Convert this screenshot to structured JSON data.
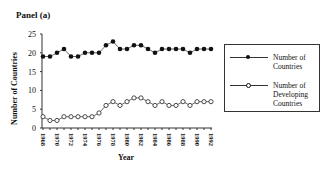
{
  "panel_title": "Panel (a)",
  "chart_data": {
    "type": "line",
    "title": "Panel (a)",
    "xlabel": "Year",
    "ylabel": "Number of Countries",
    "ylim": [
      0,
      25
    ],
    "yticks": [
      0,
      5,
      10,
      15,
      20,
      25
    ],
    "xticks": [
      "1968",
      "1970",
      "1972",
      "1974",
      "1976",
      "1978",
      "1980",
      "1982",
      "1984",
      "1986",
      "1988",
      "1990",
      "1992"
    ],
    "grid": false,
    "legend_position": "right",
    "x": [
      1968,
      1969,
      1970,
      1971,
      1972,
      1973,
      1974,
      1975,
      1976,
      1977,
      1978,
      1979,
      1980,
      1981,
      1982,
      1983,
      1984,
      1985,
      1986,
      1987,
      1988,
      1989,
      1990,
      1991,
      1992
    ],
    "series": [
      {
        "name": "Number of Countries",
        "marker": "filled-circle",
        "values": [
          19,
          19,
          20,
          21,
          19,
          19,
          20,
          20,
          20,
          22,
          23,
          21,
          21,
          22,
          22,
          21,
          20,
          21,
          21,
          21,
          21,
          20,
          21,
          21,
          21
        ]
      },
      {
        "name": "Number of Developing Countries",
        "marker": "open-circle",
        "values": [
          3,
          2,
          2,
          3,
          3,
          3,
          3,
          3,
          4,
          6,
          7,
          6,
          7,
          8,
          8,
          7,
          6,
          7,
          6,
          6,
          7,
          6,
          7,
          7,
          7
        ]
      }
    ]
  },
  "legend": {
    "items": [
      {
        "label": "Number of Countries"
      },
      {
        "label": "Number of Developing Countries"
      }
    ]
  }
}
